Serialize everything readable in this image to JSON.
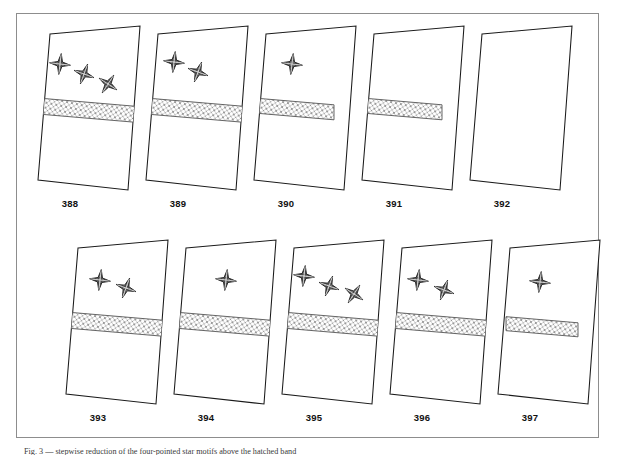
{
  "figure": {
    "title_caption": "Fig. 3 — stepwise reduction of the four-pointed star motifs above the hatched band",
    "frame_color": "#8d8d8d",
    "background_color": "#ffffff",
    "ink_color": "#1a1a1a",
    "star_fill_color": "#4a4a4a",
    "band_fill_color": "#b5b5b5"
  },
  "rows": [
    {
      "name": "top-row",
      "panels": [
        {
          "label": "388",
          "stars": 3,
          "band": true,
          "band_length": "long",
          "star_positions": [
            {
              "x": 28,
              "y": 42
            },
            {
              "x": 52,
              "y": 52
            },
            {
              "x": 76,
              "y": 62
            }
          ]
        },
        {
          "label": "389",
          "stars": 2,
          "band": true,
          "band_length": "long",
          "star_positions": [
            {
              "x": 34,
              "y": 40
            },
            {
              "x": 58,
              "y": 50
            }
          ]
        },
        {
          "label": "390",
          "stars": 1,
          "band": true,
          "band_length": "medium",
          "star_positions": [
            {
              "x": 44,
              "y": 42
            }
          ]
        },
        {
          "label": "391",
          "stars": 0,
          "band": true,
          "band_length": "medium",
          "star_positions": []
        },
        {
          "label": "392",
          "stars": 0,
          "band": false,
          "band_length": "none",
          "star_positions": []
        }
      ]
    },
    {
      "name": "bottom-row",
      "panels": [
        {
          "label": "393",
          "stars": 2,
          "band": true,
          "band_length": "long",
          "star_positions": [
            {
              "x": 40,
              "y": 44
            },
            {
              "x": 66,
              "y": 52
            }
          ]
        },
        {
          "label": "394",
          "stars": 1,
          "band": true,
          "band_length": "long",
          "star_positions": [
            {
              "x": 58,
              "y": 44
            }
          ]
        },
        {
          "label": "395",
          "stars": 3,
          "band": true,
          "band_length": "long",
          "star_positions": [
            {
              "x": 28,
              "y": 40
            },
            {
              "x": 53,
              "y": 50
            },
            {
              "x": 78,
              "y": 58
            }
          ]
        },
        {
          "label": "396",
          "stars": 2,
          "band": true,
          "band_length": "long",
          "star_positions": [
            {
              "x": 34,
              "y": 44
            },
            {
              "x": 60,
              "y": 54
            }
          ]
        },
        {
          "label": "397",
          "stars": 1,
          "band": true,
          "band_length": "short",
          "star_positions": [
            {
              "x": 48,
              "y": 46
            }
          ]
        }
      ]
    }
  ]
}
